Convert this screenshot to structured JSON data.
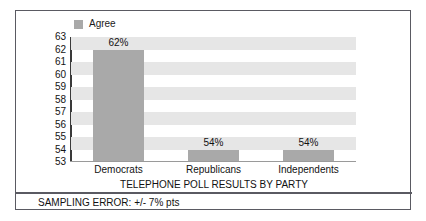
{
  "legend": {
    "swatch_name": "legend-color-swatch",
    "label": "Agree",
    "color": "#a9a9a9",
    "position": "top-left"
  },
  "footnote": {
    "text": "SAMPLING ERROR: +/- 7% pts"
  },
  "colors": {
    "bar_fill": "#a9a9a9",
    "band_fill": "#e6e6e6",
    "frame_border": "#5a5a62",
    "axis_line": "#3a3a3a",
    "text": "#111111"
  },
  "chart_data": {
    "type": "bar",
    "title": "",
    "xlabel": "TELEPHONE POLL RESULTS BY PARTY",
    "ylabel": "",
    "categories": [
      "Democrats",
      "Republicans",
      "Independents"
    ],
    "values": [
      62,
      54,
      54
    ],
    "value_labels": [
      "62%",
      "54%",
      "54%"
    ],
    "series": [
      {
        "name": "Agree",
        "values": [
          62,
          54,
          54
        ]
      }
    ],
    "ylim": [
      53,
      63
    ],
    "yticks": [
      63,
      62,
      61,
      60,
      59,
      58,
      57,
      56,
      55,
      54,
      53
    ],
    "ytick_labels": [
      "63",
      "62",
      "61",
      "60",
      "59",
      "58",
      "57",
      "56",
      "55",
      "54",
      "53"
    ],
    "grid": "horizontal-alternating-bands",
    "legend_position": "top-left",
    "annotations": [
      "SAMPLING ERROR: +/- 7% pts"
    ]
  }
}
